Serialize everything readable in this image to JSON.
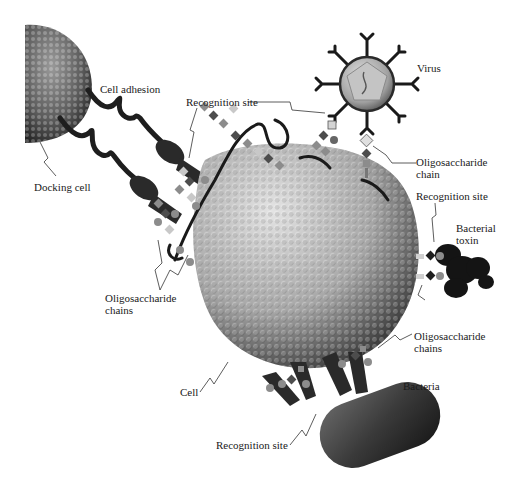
{
  "diagram": {
    "type": "biology-illustration",
    "palette": {
      "background": "#ffffff",
      "cell_light": "#d9d9d9",
      "cell_mid": "#a6a6a6",
      "cell_dark": "#3a3a3a",
      "docking_cell": "#5a5a5a",
      "protein_dark": "#1e1e1e",
      "sugar_light": "#c8c8c8",
      "sugar_mid": "#8c8c8c",
      "sugar_dark": "#4d4d4d",
      "virus_shell": "#b0b0b0",
      "text": "#1a1a1a"
    },
    "labels": {
      "cell_adhesion": "Cell adhesion",
      "docking_cell": "Docking cell",
      "recognition_site_top": "Recognition site",
      "virus": "Virus",
      "oligosaccharide_chain_virus": "Oligosaccharide\nchain",
      "recognition_site_toxin": "Recognition site",
      "bacterial_toxin": "Bacterial\ntoxin",
      "oligosaccharide_chains_left": "Oligosaccharide\nchains",
      "oligosaccharide_chains_right": "Oligosaccharide\nchains",
      "cell": "Cell",
      "bacteria": "Bacteria",
      "recognition_site_bottom": "Recognition site"
    }
  }
}
